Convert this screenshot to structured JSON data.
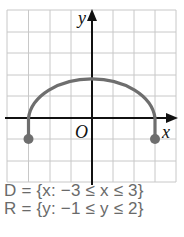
{
  "diagram": {
    "type": "coordinate-graph",
    "axis_labels": {
      "x": "x",
      "y": "y",
      "origin": "O"
    },
    "grid": {
      "x_range": [
        -4,
        4
      ],
      "y_range": [
        -3,
        5
      ],
      "spacing": 1
    },
    "curve": {
      "description": "upper semicircle-shaped arc from (-3,-1) up to (0,2) down to (3,-1)",
      "start_point": [
        -3,
        -1
      ],
      "peak": [
        0,
        2
      ],
      "end_point": [
        3,
        -1
      ],
      "endpoints_closed": true,
      "color": "#6e6e6e"
    },
    "colors": {
      "grid": "#c8c8c8",
      "axes": "#111111",
      "curve": "#6e6e6e"
    }
  },
  "domain_statement": {
    "lhs": "D",
    "text": "D = {x: −3 ≤ x ≤ 3}"
  },
  "range_statement": {
    "lhs": "R",
    "text": "R = {y: −1 ≤ y ≤ 2}"
  }
}
